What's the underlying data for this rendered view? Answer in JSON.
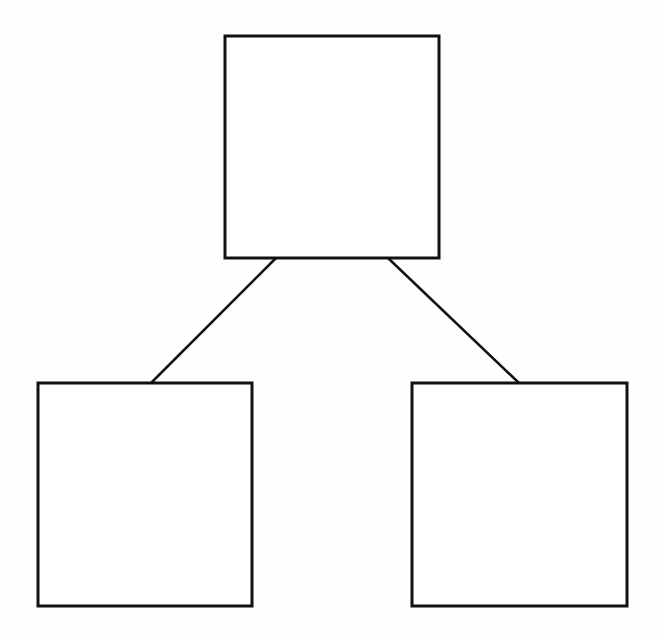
{
  "diagram": {
    "type": "tree",
    "stroke_color": "#111111",
    "background": "#fefefe",
    "nodes": [
      {
        "id": "root",
        "label": "",
        "x": 225,
        "y": 36,
        "w": 214,
        "h": 222
      },
      {
        "id": "left",
        "label": "",
        "x": 38,
        "y": 383,
        "w": 214,
        "h": 223
      },
      {
        "id": "right",
        "label": "",
        "x": 412,
        "y": 383,
        "w": 215,
        "h": 223
      }
    ],
    "edges": [
      {
        "from": "root",
        "to": "left",
        "x1": 276,
        "y1": 258,
        "x2": 151,
        "y2": 383
      },
      {
        "from": "root",
        "to": "right",
        "x1": 388,
        "y1": 258,
        "x2": 519,
        "y2": 383
      }
    ]
  }
}
